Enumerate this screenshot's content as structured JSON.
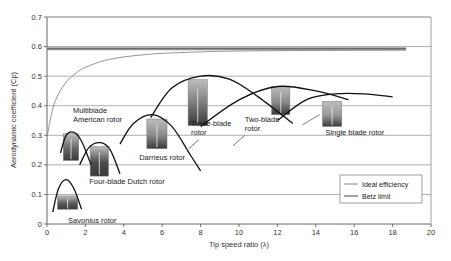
{
  "chart_data": {
    "type": "line",
    "title": "",
    "xlabel": "Tip speed ratio (λ)",
    "ylabel": "Aerodynamic coefficient (Cp)",
    "xlim": [
      0,
      20
    ],
    "ylim": [
      0,
      0.7
    ],
    "xticks": [
      0,
      2,
      4,
      6,
      8,
      10,
      12,
      14,
      16,
      18,
      20
    ],
    "yticks": [
      0,
      0.1,
      0.2,
      0.3,
      0.4,
      0.5,
      0.6,
      0.7
    ],
    "grid": "horizontal",
    "legend": {
      "position": "lower right",
      "entries": [
        "Ideal efficiency",
        "Betz limit"
      ]
    },
    "series": [
      {
        "name": "Betz limit",
        "color": "#888888",
        "x": [
          0,
          18.7
        ],
        "y": [
          0.593,
          0.593
        ]
      },
      {
        "name": "Ideal efficiency",
        "color": "#888888",
        "x": [
          0.02,
          0.3,
          0.6,
          1.0,
          1.5,
          2.0,
          3.0,
          4.0,
          5.0,
          6.0,
          8.0,
          10.0,
          14.0,
          18.7
        ],
        "y": [
          0.3,
          0.39,
          0.44,
          0.48,
          0.51,
          0.53,
          0.553,
          0.565,
          0.572,
          0.577,
          0.582,
          0.585,
          0.587,
          0.588
        ]
      },
      {
        "name": "Savonius rotor",
        "color": "#111111",
        "x": [
          0.3,
          0.6,
          1.0,
          1.4,
          1.8
        ],
        "y": [
          0.04,
          0.12,
          0.15,
          0.12,
          0.05
        ]
      },
      {
        "name": "Multiblade American rotor",
        "color": "#111111",
        "x": [
          0.7,
          1.0,
          1.4,
          1.8,
          2.3
        ],
        "y": [
          0.24,
          0.3,
          0.31,
          0.28,
          0.2
        ]
      },
      {
        "name": "Four-blade Dutch rotor",
        "color": "#111111",
        "x": [
          1.7,
          2.2,
          2.8,
          3.3,
          3.8
        ],
        "y": [
          0.2,
          0.26,
          0.275,
          0.25,
          0.17
        ]
      },
      {
        "name": "Darrieus rotor",
        "color": "#111111",
        "x": [
          3.8,
          4.5,
          5.5,
          6.5,
          7.5,
          8.0
        ],
        "y": [
          0.27,
          0.34,
          0.37,
          0.33,
          0.23,
          0.18
        ]
      },
      {
        "name": "Three-blade rotor",
        "color": "#111111",
        "x": [
          5.4,
          6.5,
          8.0,
          9.5,
          11.0,
          12.8
        ],
        "y": [
          0.36,
          0.46,
          0.5,
          0.49,
          0.43,
          0.34
        ]
      },
      {
        "name": "Two-blade rotor",
        "color": "#111111",
        "x": [
          8.0,
          10.0,
          12.0,
          14.0,
          15.7
        ],
        "y": [
          0.33,
          0.42,
          0.465,
          0.45,
          0.42
        ]
      },
      {
        "name": "Single blade rotor",
        "color": "#111111",
        "x": [
          12.0,
          13.5,
          15.0,
          16.5,
          18.0
        ],
        "y": [
          0.35,
          0.42,
          0.44,
          0.44,
          0.43
        ]
      }
    ],
    "annotations": [
      {
        "text": "Savonius rotor",
        "x": 1.1,
        "y": 0.005
      },
      {
        "text": "Multiblade",
        "x": 1.35,
        "y": 0.375
      },
      {
        "text": "American rotor",
        "x": 1.35,
        "y": 0.345
      },
      {
        "text": "Four-blade Dutch rotor",
        "x": 2.2,
        "y": 0.135
      },
      {
        "text": "Darrieus rotor",
        "x": 4.8,
        "y": 0.215
      },
      {
        "text": "Three-blade",
        "x": 7.5,
        "y": 0.33
      },
      {
        "text": "rotor",
        "x": 7.5,
        "y": 0.3
      },
      {
        "text": "Two-blade",
        "x": 10.3,
        "y": 0.345
      },
      {
        "text": "rotor",
        "x": 10.3,
        "y": 0.315
      },
      {
        "text": "Single blade rotor",
        "x": 14.5,
        "y": 0.3
      }
    ],
    "images": [
      {
        "name": "savonius-photo",
        "x": 0.55,
        "y": 0.095,
        "w": 1.05,
        "h": 0.045,
        "shade": "#5a5a5a"
      },
      {
        "name": "multiblade-photo",
        "x": 0.85,
        "y": 0.305,
        "w": 0.8,
        "h": 0.09,
        "shade": "#666666"
      },
      {
        "name": "dutch-photo",
        "x": 2.25,
        "y": 0.262,
        "w": 0.95,
        "h": 0.1,
        "shade": "#4a4a4a"
      },
      {
        "name": "darrieus-photo",
        "x": 5.2,
        "y": 0.355,
        "w": 1.05,
        "h": 0.1,
        "shade": "#8a8a8a"
      },
      {
        "name": "three-blade-photo",
        "x": 7.35,
        "y": 0.488,
        "w": 1.0,
        "h": 0.155,
        "shade": "#777777"
      },
      {
        "name": "two-blade-photo",
        "x": 11.7,
        "y": 0.465,
        "w": 0.95,
        "h": 0.095,
        "shade": "#8c8c8c"
      },
      {
        "name": "single-blade-photo",
        "x": 14.35,
        "y": 0.415,
        "w": 1.0,
        "h": 0.085,
        "shade": "#9a9a9a"
      }
    ]
  }
}
